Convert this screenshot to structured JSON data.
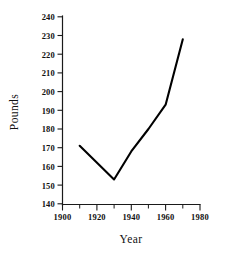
{
  "chart_data": {
    "type": "line",
    "title": "",
    "xlabel": "Year",
    "ylabel": "Pounds",
    "x": [
      1910,
      1930,
      1940,
      1950,
      1960,
      1970
    ],
    "values": [
      171,
      153,
      168,
      180,
      193,
      228
    ],
    "series": [
      {
        "name": "Pounds",
        "x": [
          1910,
          1930,
          1940,
          1950,
          1960,
          1970
        ],
        "values": [
          171,
          153,
          168,
          180,
          193,
          228
        ]
      }
    ],
    "xlim": [
      1900,
      1980
    ],
    "ylim": [
      140,
      240
    ],
    "x_major_ticks": [
      1900,
      1920,
      1940,
      1960,
      1980
    ],
    "x_minor_ticks": [
      1910,
      1930,
      1950,
      1970
    ],
    "y_ticks": [
      140,
      150,
      160,
      170,
      180,
      190,
      200,
      210,
      220,
      230,
      240
    ],
    "x_tick_labels": [
      "1900",
      "1920",
      "1940",
      "1960",
      "1980"
    ],
    "y_tick_labels": [
      "140",
      "150",
      "160",
      "170",
      "180",
      "190",
      "200",
      "210",
      "220",
      "230",
      "240"
    ],
    "grid": false,
    "legend": null,
    "legend_position": "none",
    "line_color": "#000000",
    "background_color": "#ffffff"
  },
  "axes": {
    "y_title": "Pounds",
    "x_title": "Year"
  }
}
